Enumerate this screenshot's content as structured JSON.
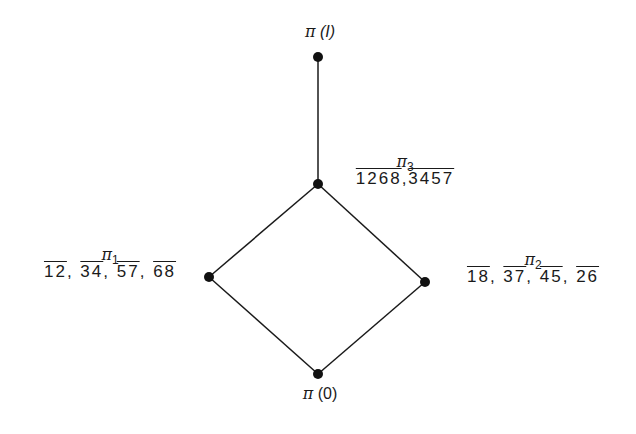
{
  "diagram": {
    "type": "partition lattice (Hasse diagram)",
    "nodes": [
      {
        "id": "top",
        "name": "π",
        "arg": "(I)",
        "x": 318,
        "y": 57
      },
      {
        "id": "pi3",
        "name": "π",
        "sub": "3",
        "partition": [
          "1268",
          "3457"
        ],
        "x": 318,
        "y": 184
      },
      {
        "id": "pi1",
        "name": "π",
        "sub": "1",
        "partition": [
          "12",
          "34",
          "57",
          "68"
        ],
        "x": 209,
        "y": 277
      },
      {
        "id": "pi2",
        "name": "π",
        "sub": "2",
        "partition": [
          "18",
          "37",
          "45",
          "26"
        ],
        "x": 425,
        "y": 282
      },
      {
        "id": "bottom",
        "name": "π",
        "arg": "(0)",
        "x": 318,
        "y": 374
      }
    ],
    "edges": [
      [
        "top",
        "pi3"
      ],
      [
        "pi3",
        "pi1"
      ],
      [
        "pi3",
        "pi2"
      ],
      [
        "pi1",
        "bottom"
      ],
      [
        "pi2",
        "bottom"
      ]
    ],
    "colors": {
      "line": "#1a1a1a",
      "node": "#111111",
      "background": "#ffffff"
    }
  },
  "labels": {
    "top": {
      "symbol": "π",
      "arg": "(I)"
    },
    "pi3": {
      "symbol": "π",
      "sub": "3",
      "b0": "1268",
      "b1": "3457",
      "sep": ","
    },
    "pi1": {
      "symbol": "π",
      "sub": "1",
      "b0": "12",
      "b1": "34",
      "b2": "57",
      "b3": "68",
      "sep": ","
    },
    "pi2": {
      "symbol": "π",
      "sub": "2",
      "b0": "18",
      "b1": "37",
      "b2": "45",
      "b3": "26",
      "sep": ","
    },
    "bottom": {
      "symbol": "π",
      "arg": "(0)"
    }
  }
}
